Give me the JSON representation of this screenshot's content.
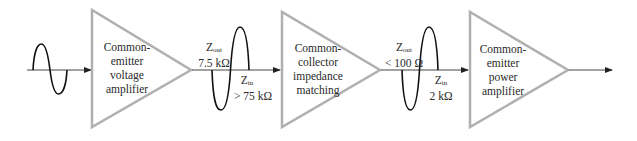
{
  "diagram": {
    "colors": {
      "triangle_stroke": "#b0b0b0",
      "wire": "#222222",
      "text": "#2a2a2a",
      "background": "#ffffff"
    },
    "input_signal": {
      "type": "sine",
      "label": ""
    },
    "stages": [
      {
        "id": "stage-1",
        "lines": [
          "Common-",
          "emitter",
          "voltage",
          "amplifier"
        ]
      },
      {
        "id": "stage-2",
        "lines": [
          "Common-",
          "collector",
          "impedance",
          "matching"
        ]
      },
      {
        "id": "stage-3",
        "lines": [
          "Common-",
          "emitter",
          "power",
          "amplifier"
        ]
      }
    ],
    "interfaces": [
      {
        "zout": {
          "symbol": "Z",
          "sub": "out",
          "value": "7.5 kΩ"
        },
        "zin": {
          "symbol": "Z",
          "sub": "in",
          "value": "> 75 kΩ"
        }
      },
      {
        "zout": {
          "symbol": "Z",
          "sub": "out",
          "value": "< 100 Ω"
        },
        "zin": {
          "symbol": "Z",
          "sub": "in",
          "value": "2 kΩ"
        }
      }
    ]
  }
}
